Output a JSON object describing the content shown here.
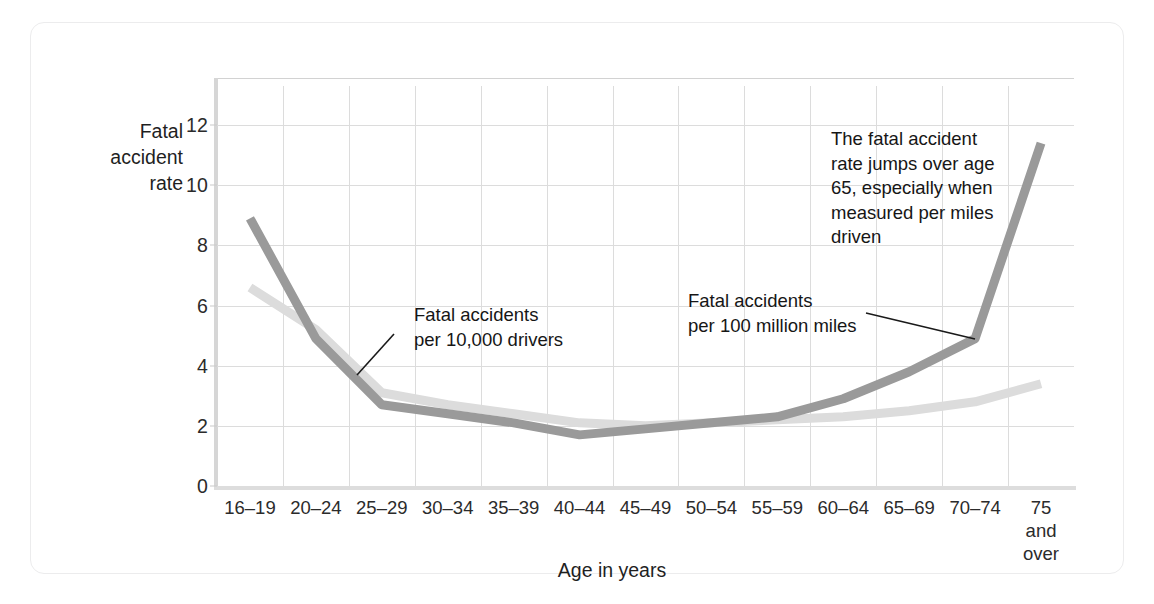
{
  "figure": {
    "ylabel_line1": "Fatal",
    "ylabel_line2": "accident",
    "ylabel_line3": "rate",
    "xlabel": "Age in years"
  },
  "annotations": {
    "drivers": "Fatal accidents\nper 10,000 drivers",
    "miles": "Fatal accidents\nper 100 million miles",
    "jump": "The fatal accident\nrate jumps over age\n65, especially when\nmeasured per miles\ndriven"
  },
  "colors": {
    "series_miles": "#9a9a9a",
    "series_drivers": "#dcdcdc",
    "grid": "#dcdcdc",
    "text": "#1f1f1f",
    "frame": "#ececed"
  },
  "chart_data": {
    "type": "line",
    "title": "",
    "xlabel": "Age in years",
    "ylabel": "Fatal accident rate",
    "ylim": [
      0,
      13.3
    ],
    "yticks": [
      0,
      2,
      4,
      6,
      8,
      10,
      12
    ],
    "grid": true,
    "legend": "annotated inline",
    "categories": [
      "16–19",
      "20–24",
      "25–29",
      "30–34",
      "35–39",
      "40–44",
      "45–49",
      "50–54",
      "55–59",
      "60–64",
      "65–69",
      "70–74",
      "75\nand\nover"
    ],
    "series": [
      {
        "name": "Fatal accidents per 100 million miles",
        "color": "#9a9a9a",
        "values": [
          8.9,
          4.9,
          2.7,
          2.4,
          2.1,
          1.7,
          1.9,
          2.1,
          2.3,
          2.9,
          3.8,
          4.9,
          11.4
        ]
      },
      {
        "name": "Fatal accidents per 10,000 drivers",
        "color": "#dcdcdc",
        "values": [
          6.6,
          5.2,
          3.1,
          2.7,
          2.4,
          2.1,
          2.0,
          2.1,
          2.2,
          2.3,
          2.5,
          2.8,
          3.4
        ]
      }
    ]
  }
}
